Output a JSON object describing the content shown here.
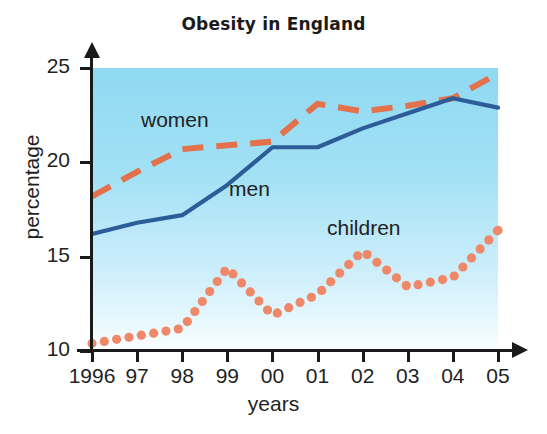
{
  "figure": {
    "title": "Obesity in England",
    "background": "#ffffff"
  },
  "axes": {
    "y_title": "percentage",
    "x_title": "years",
    "y_ticks": [
      "10",
      "15",
      "20",
      "25"
    ],
    "x_ticks": [
      "1996",
      "97",
      "98",
      "99",
      "00",
      "01",
      "02",
      "03",
      "04",
      "05"
    ]
  },
  "series_labels": {
    "women": "women",
    "men": "men",
    "children": "children"
  },
  "colors": {
    "women": "#e2714c",
    "men": "#2c5d99",
    "children": "#ef8868",
    "plot_top": "#8fd9f2",
    "plot_bottom": "#fdfeff",
    "axis": "#1a1a1a"
  },
  "chart_data": {
    "type": "line",
    "title": "Obesity in England",
    "xlabel": "years",
    "ylabel": "percentage",
    "xlim": [
      1996,
      2005
    ],
    "ylim": [
      10,
      25
    ],
    "grid": false,
    "legend": "inline-labels",
    "categories": [
      "1996",
      "97",
      "98",
      "99",
      "00",
      "01",
      "02",
      "03",
      "04",
      "05"
    ],
    "x": [
      1996,
      1997,
      1998,
      1999,
      2000,
      2001,
      2002,
      2003,
      2004,
      2005
    ],
    "series": [
      {
        "name": "women",
        "style": "dashed",
        "color": "#e2714c",
        "values": [
          18.2,
          19.5,
          20.7,
          20.9,
          21.1,
          23.1,
          22.7,
          23.0,
          23.4,
          24.7
        ]
      },
      {
        "name": "men",
        "style": "solid",
        "color": "#2c5d99",
        "values": [
          16.2,
          16.8,
          17.2,
          18.8,
          20.8,
          20.8,
          21.8,
          22.6,
          23.4,
          22.9
        ]
      },
      {
        "name": "children",
        "style": "dotted",
        "color": "#ef8868",
        "values": [
          10.4,
          10.8,
          11.2,
          14.4,
          11.9,
          13.0,
          15.3,
          13.4,
          13.9,
          16.4
        ]
      }
    ]
  }
}
